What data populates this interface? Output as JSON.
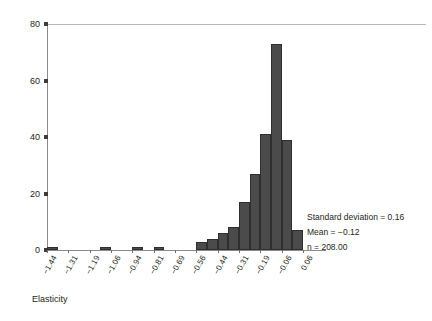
{
  "chart_data": {
    "type": "bar",
    "title": "",
    "xlabel": "Elasticity",
    "ylabel": "",
    "ylim": [
      0,
      80
    ],
    "yticks": [
      0,
      20,
      40,
      60,
      80
    ],
    "grid": false,
    "legend": null,
    "categories": [
      "-1.44",
      "-1.31",
      "-1.19",
      "-1.06",
      "-0.94",
      "-0.81",
      "-0.69",
      "-0.56",
      "-0.44",
      "-0.31",
      "-0.19",
      "-0.06",
      "0.06"
    ],
    "bin_edges": [
      "-1.44",
      "-1.31",
      "-1.19",
      "-1.06",
      "-0.94",
      "-0.81",
      "-0.69",
      "-0.56",
      "-0.44",
      "-0.31",
      "-0.19",
      "-0.06",
      "0.06"
    ],
    "bins": [
      {
        "label": "-1.44",
        "value": 1
      },
      {
        "label": "-1.38",
        "value": 0
      },
      {
        "label": "-1.31",
        "value": 0
      },
      {
        "label": "-1.25",
        "value": 0
      },
      {
        "label": "-1.19",
        "value": 0
      },
      {
        "label": "-1.12",
        "value": 1
      },
      {
        "label": "-1.06",
        "value": 0
      },
      {
        "label": "-1.00",
        "value": 0
      },
      {
        "label": "-0.94",
        "value": 1
      },
      {
        "label": "-0.88",
        "value": 0
      },
      {
        "label": "-0.81",
        "value": 1
      },
      {
        "label": "-0.75",
        "value": 0
      },
      {
        "label": "-0.69",
        "value": 0
      },
      {
        "label": "-0.62",
        "value": 0
      },
      {
        "label": "-0.56",
        "value": 3
      },
      {
        "label": "-0.50",
        "value": 4
      },
      {
        "label": "-0.44",
        "value": 6
      },
      {
        "label": "-0.38",
        "value": 8
      },
      {
        "label": "-0.31",
        "value": 17
      },
      {
        "label": "-0.25",
        "value": 27
      },
      {
        "label": "-0.19",
        "value": 41
      },
      {
        "label": "-0.12",
        "value": 73
      },
      {
        "label": "-0.06",
        "value": 39
      },
      {
        "label": "0.00",
        "value": 7
      }
    ],
    "annotations": {
      "std_label": "Standard deviation = 0.16",
      "mean_label": "Mean = −0.12",
      "n_label": "n = 208.00"
    },
    "colors": {
      "bar_fill": "#4b4b4b",
      "bar_edge": "#2f2f2f",
      "axis": "#8b8b8b",
      "text": "#231f20"
    }
  }
}
